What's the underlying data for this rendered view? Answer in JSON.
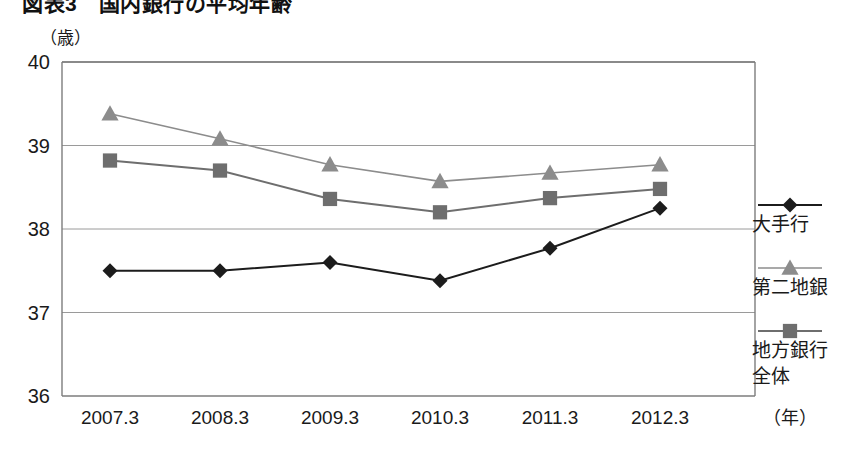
{
  "title": "図表3　国内銀行の平均年齢",
  "unit_label": "（歳）",
  "x_axis_unit": "（年）",
  "legend": {
    "items": [
      {
        "label": "大手行",
        "color": "#1c1c1c",
        "marker": "diamond"
      },
      {
        "label": "第二地銀",
        "color": "#8c8c8c",
        "marker": "triangle"
      },
      {
        "label": "地方銀行全体",
        "label_line1": "地方銀行",
        "label_line2": "全体",
        "color": "#6e6e6e",
        "marker": "square"
      }
    ]
  },
  "chart_data": {
    "type": "line",
    "title": "図表3　国内銀行の平均年齢",
    "xlabel": "（年）",
    "ylabel": "（歳）",
    "categories": [
      "2007.3",
      "2008.3",
      "2009.3",
      "2010.3",
      "2011.3",
      "2012.3"
    ],
    "ylim": [
      36,
      40
    ],
    "yticks": [
      36,
      37,
      38,
      39,
      40
    ],
    "grid": true,
    "legend_position": "inside-right",
    "series": [
      {
        "name": "大手行",
        "color": "#1c1c1c",
        "marker": "diamond",
        "values": [
          37.5,
          37.5,
          37.6,
          37.38,
          37.77,
          38.25
        ]
      },
      {
        "name": "第二地銀",
        "color": "#8c8c8c",
        "marker": "triangle",
        "values": [
          39.38,
          39.08,
          38.77,
          38.57,
          38.67,
          38.77
        ]
      },
      {
        "name": "地方銀行全体",
        "color": "#6e6e6e",
        "marker": "square",
        "values": [
          38.82,
          38.7,
          38.36,
          38.2,
          38.37,
          38.48
        ]
      }
    ]
  }
}
